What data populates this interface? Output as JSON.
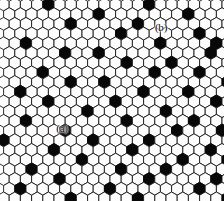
{
  "figure": {
    "width": 224,
    "height": 201,
    "background_color": "#ffffff"
  },
  "lattice": {
    "cell_shape": "pointy-top-hexagon",
    "cell_width": 11.2,
    "cell_height": 12.9,
    "row_pitch": 9.7,
    "columns": 21,
    "rows": 22,
    "empty_cell_fill": "#fdfdfd",
    "empty_cell_stroke": "#1a1a1a",
    "filled_cell_fill": "#080808",
    "stroke_width": 0.9,
    "origin_x": -2.0,
    "origin_y": -2.0
  },
  "occupancy": {
    "description": "Row-indexed list of column indices holding black (occupied) hexagons.",
    "filled_sites": [
      {
        "row": 0,
        "cols": [
          4,
          13,
          21
        ]
      },
      {
        "row": 1,
        "cols": [
          8,
          16,
          24
        ]
      },
      {
        "row": 2,
        "cols": [
          6,
          12,
          22,
          27
        ]
      },
      {
        "row": 3,
        "cols": [
          10,
          17,
          20,
          26
        ]
      },
      {
        "row": 4,
        "cols": [
          2,
          14,
          19,
          24,
          29
        ]
      },
      {
        "row": 5,
        "cols": [
          5,
          8,
          18,
          23
        ]
      },
      {
        "row": 6,
        "cols": [
          11,
          15,
          21,
          27
        ]
      },
      {
        "row": 7,
        "cols": [
          3,
          13,
          17,
          25
        ]
      },
      {
        "row": 8,
        "cols": [
          6,
          9,
          20,
          23,
          28
        ]
      },
      {
        "row": 9,
        "cols": [
          1,
          12,
          16,
          26
        ]
      },
      {
        "row": 10,
        "cols": [
          4,
          10,
          19,
          22
        ]
      },
      {
        "row": 11,
        "cols": [
          7,
          14,
          24,
          29
        ]
      },
      {
        "row": 12,
        "cols": [
          2,
          11,
          17,
          21,
          27
        ]
      },
      {
        "row": 13,
        "cols": [
          5,
          15,
          19,
          25
        ]
      },
      {
        "row": 14,
        "cols": [
          0,
          8,
          13,
          23,
          28
        ]
      },
      {
        "row": 15,
        "cols": [
          4,
          11,
          18,
          21
        ]
      },
      {
        "row": 16,
        "cols": [
          7,
          16,
          20,
          26
        ]
      },
      {
        "row": 17,
        "cols": [
          2,
          10,
          14,
          24,
          29
        ]
      },
      {
        "row": 18,
        "cols": [
          5,
          13,
          19,
          22,
          27
        ]
      },
      {
        "row": 19,
        "cols": [
          1,
          9,
          17,
          25
        ]
      },
      {
        "row": 20,
        "cols": [
          6,
          12,
          20,
          23,
          28
        ]
      },
      {
        "row": 21,
        "cols": [
          3,
          15,
          18,
          26
        ]
      }
    ]
  },
  "labels": [
    {
      "id": "label-a",
      "text": "(a)",
      "x": 62,
      "y": 128,
      "color": "#0a0a0a"
    },
    {
      "id": "label-b",
      "text": "(b)",
      "x": 161,
      "y": 27,
      "color": "#0a0a0a"
    }
  ]
}
